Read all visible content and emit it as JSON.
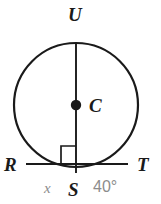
{
  "figure": {
    "type": "circle-geometry-diagram",
    "background_color": "#ffffff",
    "stroke_color": "#1a1a1a",
    "label_color": "#1a1a1a",
    "measure_color": "#8c8c8c",
    "circle": {
      "center_label": "C",
      "cx": 76,
      "cy": 105,
      "r": 62,
      "stroke_width": 2.2
    },
    "center_point": {
      "label": "C",
      "x": 76,
      "y": 105,
      "dot_radius": 5
    },
    "diameter": {
      "name": "US",
      "from_label": "U",
      "to_label": "S",
      "x1": 76,
      "y1": 43,
      "x2": 76,
      "y2": 172
    },
    "chord": {
      "name": "RT",
      "from_label": "R",
      "to_label": "T",
      "x1": 27,
      "y1": 164,
      "x2": 127,
      "y2": 164
    },
    "right_angle_marker": {
      "present": true,
      "x": 62,
      "y": 142,
      "size": 14
    },
    "labels": {
      "U": "U",
      "C": "C",
      "R": "R",
      "S": "S",
      "T": "T",
      "arc_x": "x",
      "arc_angle": "40°"
    }
  }
}
